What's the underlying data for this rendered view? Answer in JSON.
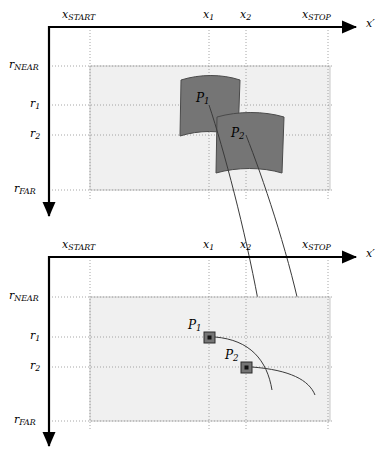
{
  "figure": {
    "colors": {
      "axis": "#000000",
      "grid_dotted": "#8f8f8f",
      "region_fill": "#f0f0f0",
      "region_stroke": "#c8c8c8",
      "patch_fill": "#757575",
      "patch_stroke": "#4a4a4a",
      "curve": "#3a3a3a",
      "marker_fill": "#757575",
      "marker_stroke": "#2b2b2b",
      "marker_dot": "#111111"
    }
  },
  "panels": [
    {
      "id": "upper",
      "name": "upper-panel",
      "x_axis": {
        "name": "x-prime-axis",
        "label": "x",
        "label_prime": "′",
        "ticks": [
          {
            "name": "x-start",
            "label": "x",
            "subscript": "START",
            "value": "x_START"
          },
          {
            "name": "x-1",
            "label": "x",
            "subscript": "1",
            "value": "x_1"
          },
          {
            "name": "x-2",
            "label": "x",
            "subscript": "2",
            "value": "x_2"
          },
          {
            "name": "x-stop",
            "label": "x",
            "subscript": "STOP",
            "value": "x_STOP"
          }
        ]
      },
      "r_axis": {
        "name": "r-axis",
        "ticks": [
          {
            "name": "r-near",
            "label": "r",
            "subscript": "NEAR",
            "value": "r_NEAR"
          },
          {
            "name": "r-1",
            "label": "r",
            "subscript": "1",
            "value": "r_1"
          },
          {
            "name": "r-2",
            "label": "r",
            "subscript": "2",
            "value": "r_2"
          },
          {
            "name": "r-far",
            "label": "r",
            "subscript": "FAR",
            "value": "r_FAR"
          }
        ]
      },
      "patches": [
        {
          "name": "patch-p1",
          "label": "P",
          "subscript": "1",
          "value": "P_1"
        },
        {
          "name": "patch-p2",
          "label": "P",
          "subscript": "2",
          "value": "P_2"
        }
      ]
    },
    {
      "id": "lower",
      "name": "lower-panel",
      "x_axis": {
        "name": "x-prime-axis",
        "label": "x",
        "label_prime": "′",
        "ticks": [
          {
            "name": "x-start",
            "label": "x",
            "subscript": "START",
            "value": "x_START"
          },
          {
            "name": "x-1",
            "label": "x",
            "subscript": "1",
            "value": "x_1"
          },
          {
            "name": "x-2",
            "label": "x",
            "subscript": "2",
            "value": "x_2"
          },
          {
            "name": "x-stop",
            "label": "x",
            "subscript": "STOP",
            "value": "x_STOP"
          }
        ]
      },
      "r_axis": {
        "name": "r-axis",
        "ticks": [
          {
            "name": "r-near",
            "label": "r",
            "subscript": "NEAR",
            "value": "r_NEAR"
          },
          {
            "name": "r-1",
            "label": "r",
            "subscript": "1",
            "value": "r_1"
          },
          {
            "name": "r-2",
            "label": "r",
            "subscript": "2",
            "value": "r_2"
          },
          {
            "name": "r-far",
            "label": "r",
            "subscript": "FAR",
            "value": "r_FAR"
          }
        ]
      },
      "markers": [
        {
          "name": "marker-p1",
          "label": "P",
          "subscript": "1",
          "value": "P_1"
        },
        {
          "name": "marker-p2",
          "label": "P",
          "subscript": "2",
          "value": "P_2"
        }
      ]
    }
  ],
  "labels": {
    "upper": {
      "x_prime": "x′",
      "x_start_base": "x",
      "x_start_sub": "START",
      "x1_base": "x",
      "x1_sub": "1",
      "x2_base": "x",
      "x2_sub": "2",
      "x_stop_base": "x",
      "x_stop_sub": "STOP",
      "r_near_base": "r",
      "r_near_sub": "NEAR",
      "r1_base": "r",
      "r1_sub": "1",
      "r2_base": "r",
      "r2_sub": "2",
      "r_far_base": "r",
      "r_far_sub": "FAR",
      "p1_base": "P",
      "p1_sub": "1",
      "p2_base": "P",
      "p2_sub": "2"
    },
    "lower": {
      "x_prime": "x′",
      "x_start_base": "x",
      "x_start_sub": "START",
      "x1_base": "x",
      "x1_sub": "1",
      "x2_base": "x",
      "x2_sub": "2",
      "x_stop_base": "x",
      "x_stop_sub": "STOP",
      "r_near_base": "r",
      "r_near_sub": "NEAR",
      "r1_base": "r",
      "r1_sub": "1",
      "r2_base": "r",
      "r2_sub": "2",
      "r_far_base": "r",
      "r_far_sub": "FAR",
      "p1_base": "P",
      "p1_sub": "1",
      "p2_base": "P",
      "p2_sub": "2"
    }
  },
  "geometry": {
    "upper": {
      "axis_x": 49,
      "axis_y": 27,
      "x_start": 90,
      "x_1": 209,
      "x_2": 246,
      "x_stop": 328,
      "r_near": 66,
      "r_1": 105,
      "r_2": 135,
      "r_far": 190,
      "region_right": 330,
      "arrow_x_end": 362,
      "arrow_y_end": 222
    },
    "lower": {
      "axis_x": 49,
      "axis_y": 257,
      "x_start": 90,
      "x_1": 209,
      "x_2": 246,
      "x_stop": 328,
      "r_near": 297,
      "r_1": 337,
      "r_2": 367,
      "r_far": 421,
      "region_right": 330,
      "arrow_x_end": 362,
      "arrow_y_end": 452
    }
  }
}
